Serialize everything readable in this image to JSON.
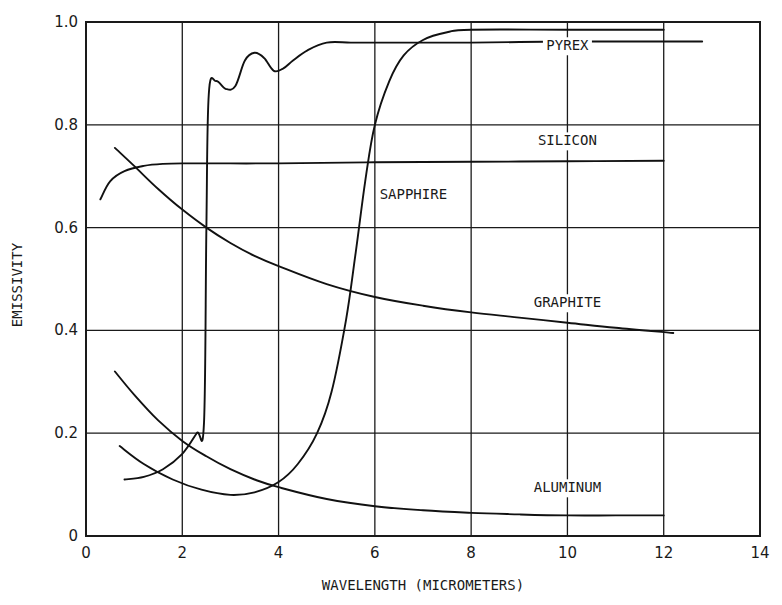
{
  "chart_data": {
    "type": "line",
    "title": "",
    "xlabel": "WAVELENGTH (MICROMETERS)",
    "ylabel": "EMISSIVITY",
    "xlim": [
      0,
      14
    ],
    "ylim": [
      0,
      1.0
    ],
    "xticks": [
      0,
      2,
      4,
      6,
      8,
      10,
      12,
      14
    ],
    "xtick_labels": [
      "0",
      "2",
      "4",
      "6",
      "8",
      "10",
      "12",
      "14"
    ],
    "yticks": [
      0,
      0.2,
      0.4,
      0.6,
      0.8,
      1.0
    ],
    "ytick_labels": [
      "0",
      "0.2",
      "0.4",
      "0.6",
      "0.8",
      "1.0"
    ],
    "grid": true,
    "legend": "inline curve labels",
    "series": [
      {
        "name": "PYREX",
        "label_pos": [
          10,
          0.945
        ],
        "x": [
          0.8,
          1.2,
          1.6,
          2.0,
          2.3,
          2.45,
          2.5,
          2.55,
          2.7,
          2.9,
          3.1,
          3.3,
          3.5,
          3.7,
          3.9,
          4.1,
          4.3,
          4.6,
          5.0,
          5.5,
          6.0,
          8.0,
          10.0,
          12.0,
          12.8
        ],
        "y": [
          0.11,
          0.115,
          0.13,
          0.16,
          0.2,
          0.22,
          0.6,
          0.86,
          0.885,
          0.87,
          0.875,
          0.925,
          0.94,
          0.93,
          0.905,
          0.91,
          0.925,
          0.945,
          0.96,
          0.96,
          0.96,
          0.96,
          0.962,
          0.962,
          0.962
        ]
      },
      {
        "name": "SILICON",
        "label_pos": [
          10,
          0.76
        ],
        "x": [
          0.3,
          0.5,
          0.8,
          1.2,
          1.6,
          2.0,
          3.0,
          4.0,
          6.0,
          8.0,
          10.0,
          12.0
        ],
        "y": [
          0.655,
          0.69,
          0.71,
          0.72,
          0.724,
          0.725,
          0.725,
          0.725,
          0.727,
          0.728,
          0.729,
          0.73
        ]
      },
      {
        "name": "SAPPHIRE",
        "label_pos": [
          6.8,
          0.655
        ],
        "x": [
          0.7,
          1.2,
          1.8,
          2.4,
          3.0,
          3.5,
          4.0,
          4.4,
          4.8,
          5.1,
          5.4,
          5.6,
          5.8,
          6.0,
          6.3,
          6.6,
          7.0,
          7.5,
          8.0,
          10.0,
          12.0
        ],
        "y": [
          0.175,
          0.14,
          0.11,
          0.09,
          0.08,
          0.085,
          0.105,
          0.14,
          0.2,
          0.28,
          0.42,
          0.55,
          0.69,
          0.8,
          0.885,
          0.935,
          0.965,
          0.98,
          0.985,
          0.985,
          0.985
        ]
      },
      {
        "name": "GRAPHITE",
        "label_pos": [
          10,
          0.445
        ],
        "x": [
          0.6,
          1.0,
          1.5,
          2.0,
          2.5,
          3.0,
          3.5,
          4.0,
          5.0,
          6.0,
          7.0,
          8.0,
          9.0,
          10.0,
          11.0,
          12.2
        ],
        "y": [
          0.755,
          0.72,
          0.675,
          0.635,
          0.6,
          0.57,
          0.545,
          0.525,
          0.49,
          0.465,
          0.448,
          0.435,
          0.425,
          0.415,
          0.405,
          0.395
        ]
      },
      {
        "name": "ALUMINUM",
        "label_pos": [
          10,
          0.085
        ],
        "x": [
          0.6,
          1.0,
          1.5,
          2.0,
          2.5,
          3.0,
          3.5,
          4.0,
          5.0,
          6.0,
          7.0,
          8.0,
          9.0,
          10.0,
          11.0,
          12.0
        ],
        "y": [
          0.32,
          0.275,
          0.225,
          0.185,
          0.155,
          0.13,
          0.11,
          0.095,
          0.072,
          0.058,
          0.05,
          0.045,
          0.042,
          0.04,
          0.04,
          0.04
        ]
      }
    ]
  },
  "layout": {
    "plot": {
      "left": 86,
      "right": 760,
      "top": 22,
      "bottom": 536
    },
    "ink_color": "#111111",
    "background": "#ffffff"
  }
}
